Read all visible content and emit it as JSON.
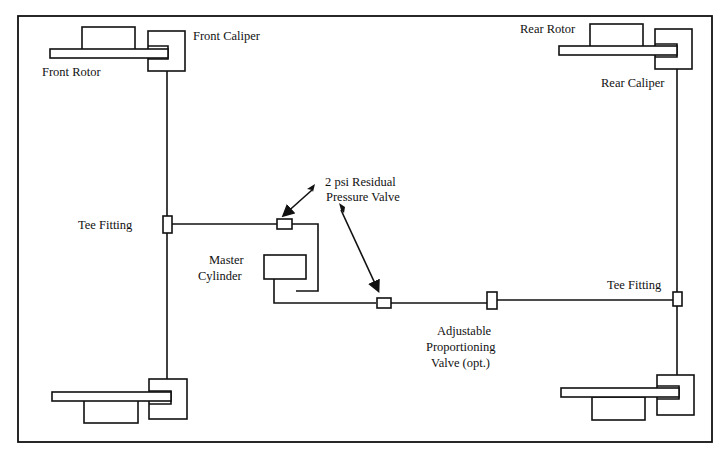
{
  "diagram": {
    "labels": {
      "front_caliper": "Front Caliper",
      "front_rotor": "Front Rotor",
      "rear_rotor": "Rear Rotor",
      "rear_caliper": "Rear  Caliper",
      "tee_fitting_left": "Tee Fitting",
      "tee_fitting_right": "Tee Fitting",
      "residual_valve_line1": "2  psi  Residual",
      "residual_valve_line2": "Pressure Valve",
      "master_cylinder_line1": "Master",
      "master_cylinder_line2": "Cylinder",
      "prop_valve_line1": "Adjustable",
      "prop_valve_line2": "Proportioning",
      "prop_valve_line3": "Valve (opt.)"
    },
    "components": [
      {
        "id": "front-left-brake",
        "type": "rotor+caliper"
      },
      {
        "id": "front-right-brake",
        "type": "rotor+caliper"
      },
      {
        "id": "rear-left-brake",
        "type": "rotor+caliper"
      },
      {
        "id": "rear-right-brake",
        "type": "rotor+caliper"
      },
      {
        "id": "front-tee-fitting",
        "type": "tee"
      },
      {
        "id": "rear-tee-fitting",
        "type": "tee"
      },
      {
        "id": "front-residual-valve",
        "type": "valve",
        "spec": "2 psi"
      },
      {
        "id": "rear-residual-valve",
        "type": "valve",
        "spec": "2 psi"
      },
      {
        "id": "master-cylinder",
        "type": "master-cylinder"
      },
      {
        "id": "proportioning-valve",
        "type": "valve",
        "optional": true
      }
    ]
  }
}
